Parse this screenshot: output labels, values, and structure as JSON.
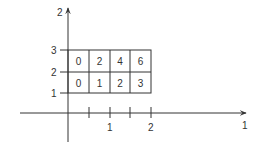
{
  "axes": {
    "vertical_label": "2",
    "horizontal_label": "1",
    "x_ticks": [
      "1",
      "2"
    ],
    "y_ticks": [
      "1",
      "2",
      "3"
    ]
  },
  "grid": {
    "rows": [
      [
        "0",
        "2",
        "4",
        "6"
      ],
      [
        "0",
        "1",
        "2",
        "3"
      ]
    ]
  },
  "colors": {
    "line": "#333333",
    "text": "#333333"
  }
}
